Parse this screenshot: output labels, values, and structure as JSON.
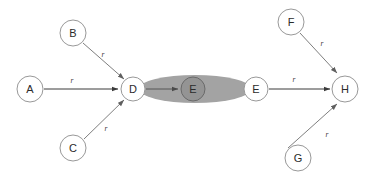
{
  "diagram": {
    "type": "directed-graph",
    "background_color": "#ffffff",
    "width": 373,
    "height": 180,
    "node_fill": "#ffffff",
    "node_stroke": "#999999",
    "group_fill": "#a3a3a3",
    "shaded_node_fill": "#949494",
    "edge_color": "#6f6f6f",
    "nodes": [
      {
        "id": "A",
        "label": "A",
        "cx": 30,
        "cy": 89,
        "r": 13,
        "style": "plain"
      },
      {
        "id": "B",
        "label": "B",
        "cx": 73,
        "cy": 33,
        "r": 13,
        "style": "plain"
      },
      {
        "id": "C",
        "label": "C",
        "cx": 73,
        "cy": 148,
        "r": 13,
        "style": "plain"
      },
      {
        "id": "D",
        "label": "D",
        "cx": 133,
        "cy": 89,
        "r": 12,
        "style": "plain"
      },
      {
        "id": "E1",
        "label": "E",
        "cx": 193,
        "cy": 89,
        "r": 12,
        "style": "shaded"
      },
      {
        "id": "E2",
        "label": "E",
        "cx": 256,
        "cy": 89,
        "r": 12,
        "style": "plain"
      },
      {
        "id": "F",
        "label": "F",
        "cx": 291,
        "cy": 22,
        "r": 13,
        "style": "plain"
      },
      {
        "id": "G",
        "label": "G",
        "cx": 298,
        "cy": 158,
        "r": 13,
        "style": "plain"
      },
      {
        "id": "H",
        "label": "H",
        "cx": 345,
        "cy": 89,
        "r": 13,
        "style": "plain"
      }
    ],
    "group_ellipse": {
      "cx": 195,
      "cy": 89,
      "rx": 56,
      "ry": 14
    },
    "edges": [
      {
        "from": "A",
        "to": "D",
        "label": "r",
        "label_x": 72,
        "label_y": 80,
        "style": "dark"
      },
      {
        "from": "B",
        "to": "D",
        "label": "r",
        "label_x": 103,
        "label_y": 54,
        "style": "light"
      },
      {
        "from": "C",
        "to": "D",
        "label": "r",
        "label_x": 106,
        "label_y": 128,
        "style": "light"
      },
      {
        "from": "D",
        "to": "E1",
        "label": "",
        "label_x": 0,
        "label_y": 0,
        "style": "inner"
      },
      {
        "from": "E2",
        "to": "H",
        "label": "r",
        "label_x": 294,
        "label_y": 79,
        "style": "dark"
      },
      {
        "from": "F",
        "to": "H",
        "label": "r",
        "label_x": 322,
        "label_y": 43,
        "style": "light"
      },
      {
        "from": "G",
        "to": "H",
        "label": "r",
        "label_x": 327,
        "label_y": 134,
        "style": "light"
      }
    ]
  }
}
